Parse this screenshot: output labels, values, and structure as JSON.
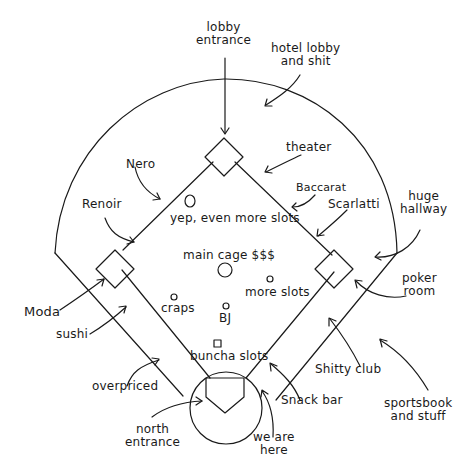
{
  "diagram": {
    "type": "hand-drawn casino map on baseball field",
    "labels": {
      "lobby_entrance": "lobby\nentrance",
      "hotel_lobby": "hotel lobby\nand shit",
      "theater": "theater",
      "nero": "Nero",
      "baccarat": "Baccarat",
      "renoir": "Renoir",
      "scarlatti": "Scarlatti",
      "huge_hallway": "huge\nhallway",
      "yep_more_slots": "yep, even more slots",
      "main_cage": "main cage $$$",
      "more_slots": "more slots",
      "poker_room": "poker\nroom",
      "moda": "Moda",
      "craps": "craps",
      "bj": "BJ",
      "sushi": "sushi",
      "buncha_slots": "buncha slots",
      "shitty_club": "Shitty club",
      "overpriced": "overpriced",
      "snack_bar": "Snack bar",
      "sportsbook": "sportsbook\nand stuff",
      "north_entrance": "north\nentrance",
      "we_are_here": "we are\nhere"
    },
    "stroke_color": "#1a1a1a",
    "background": "#ffffff"
  }
}
